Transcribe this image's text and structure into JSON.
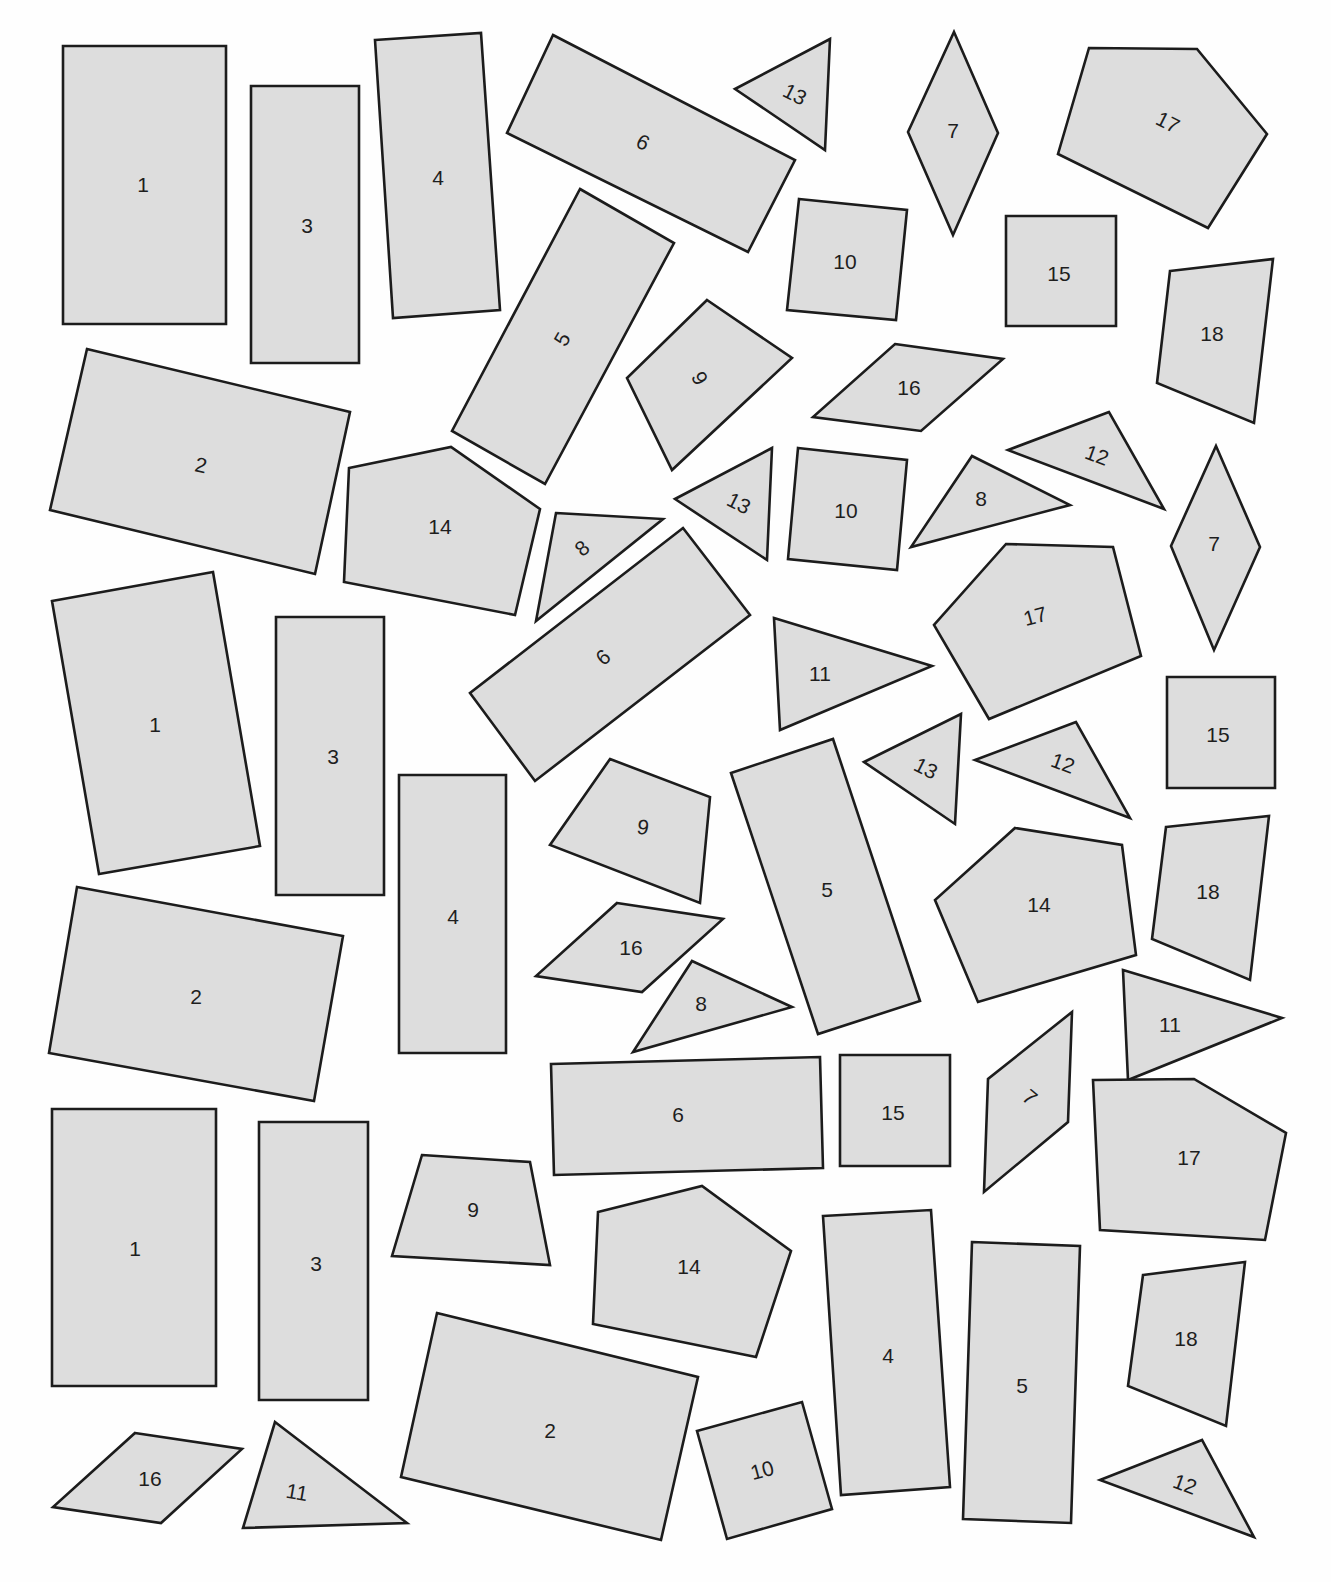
{
  "worksheet": {
    "fill_color": "#dddddd",
    "stroke_color": "#1c1c1c",
    "background_color": "#fefefe"
  },
  "shapes": [
    {
      "label": "1",
      "points": [
        [
          63,
          46
        ],
        [
          226,
          46
        ],
        [
          226,
          324
        ],
        [
          63,
          324
        ]
      ],
      "lx": 143,
      "ly": 184,
      "rot": 0
    },
    {
      "label": "3",
      "points": [
        [
          251,
          86
        ],
        [
          359,
          86
        ],
        [
          359,
          363
        ],
        [
          251,
          363
        ]
      ],
      "lx": 307,
      "ly": 225,
      "rot": 0
    },
    {
      "label": "4",
      "points": [
        [
          375,
          40
        ],
        [
          481,
          33
        ],
        [
          500,
          310
        ],
        [
          393,
          318
        ]
      ],
      "lx": 438,
      "ly": 177,
      "rot": 0
    },
    {
      "label": "6",
      "points": [
        [
          553,
          35
        ],
        [
          795,
          160
        ],
        [
          748,
          252
        ],
        [
          507,
          133
        ]
      ],
      "lx": 643,
      "ly": 142,
      "rot": 27
    },
    {
      "label": "13",
      "points": [
        [
          830,
          39
        ],
        [
          735,
          89
        ],
        [
          825,
          150
        ]
      ],
      "lx": 795,
      "ly": 94,
      "rot": 27
    },
    {
      "label": "7",
      "points": [
        [
          954,
          32
        ],
        [
          998,
          133
        ],
        [
          953,
          235
        ],
        [
          908,
          132
        ]
      ],
      "lx": 953,
      "ly": 130,
      "rot": 0
    },
    {
      "label": "17",
      "points": [
        [
          1089,
          48
        ],
        [
          1197,
          49
        ],
        [
          1267,
          134
        ],
        [
          1208,
          228
        ],
        [
          1058,
          154
        ]
      ],
      "lx": 1168,
      "ly": 122,
      "rot": 27
    },
    {
      "label": "10",
      "points": [
        [
          799,
          199
        ],
        [
          907,
          210
        ],
        [
          896,
          320
        ],
        [
          787,
          310
        ]
      ],
      "lx": 845,
      "ly": 261,
      "rot": 0
    },
    {
      "label": "15",
      "points": [
        [
          1006,
          216
        ],
        [
          1116,
          216
        ],
        [
          1116,
          326
        ],
        [
          1006,
          326
        ]
      ],
      "lx": 1059,
      "ly": 273,
      "rot": 0
    },
    {
      "label": "18",
      "points": [
        [
          1170,
          271
        ],
        [
          1273,
          259
        ],
        [
          1254,
          423
        ],
        [
          1157,
          383
        ]
      ],
      "lx": 1212,
      "ly": 333,
      "rot": 0
    },
    {
      "label": "5",
      "points": [
        [
          580,
          189
        ],
        [
          674,
          243
        ],
        [
          545,
          484
        ],
        [
          452,
          431
        ]
      ],
      "lx": 562,
      "ly": 339,
      "rot": -60
    },
    {
      "label": "2",
      "points": [
        [
          87,
          349
        ],
        [
          350,
          412
        ],
        [
          315,
          574
        ],
        [
          50,
          510
        ]
      ],
      "lx": 201,
      "ly": 465,
      "rot": 12
    },
    {
      "label": "9",
      "points": [
        [
          707,
          300
        ],
        [
          792,
          358
        ],
        [
          672,
          470
        ],
        [
          627,
          378
        ]
      ],
      "lx": 700,
      "ly": 378,
      "rot": 60
    },
    {
      "label": "16",
      "points": [
        [
          895,
          344
        ],
        [
          1003,
          359
        ],
        [
          921,
          431
        ],
        [
          813,
          417
        ]
      ],
      "lx": 909,
      "ly": 387,
      "rot": 0
    },
    {
      "label": "14",
      "points": [
        [
          349,
          468
        ],
        [
          451,
          447
        ],
        [
          540,
          509
        ],
        [
          515,
          615
        ],
        [
          344,
          582
        ]
      ],
      "lx": 440,
      "ly": 526,
      "rot": 0
    },
    {
      "label": "8",
      "points": [
        [
          556,
          513
        ],
        [
          663,
          519
        ],
        [
          536,
          621
        ]
      ],
      "lx": 582,
      "ly": 548,
      "rot": -40
    },
    {
      "label": "13",
      "points": [
        [
          772,
          448
        ],
        [
          675,
          499
        ],
        [
          767,
          560
        ]
      ],
      "lx": 739,
      "ly": 503,
      "rot": 27
    },
    {
      "label": "10",
      "points": [
        [
          798,
          448
        ],
        [
          907,
          460
        ],
        [
          897,
          570
        ],
        [
          788,
          559
        ]
      ],
      "lx": 846,
      "ly": 510,
      "rot": 0
    },
    {
      "label": "8",
      "points": [
        [
          972,
          456
        ],
        [
          1070,
          505
        ],
        [
          911,
          547
        ]
      ],
      "lx": 981,
      "ly": 498,
      "rot": 0
    },
    {
      "label": "12",
      "points": [
        [
          1109,
          412
        ],
        [
          1008,
          450
        ],
        [
          1164,
          509
        ]
      ],
      "lx": 1097,
      "ly": 455,
      "rot": 20
    },
    {
      "label": "7",
      "points": [
        [
          1216,
          446
        ],
        [
          1260,
          547
        ],
        [
          1214,
          650
        ],
        [
          1171,
          546
        ]
      ],
      "lx": 1214,
      "ly": 543,
      "rot": 0
    },
    {
      "label": "1",
      "points": [
        [
          52,
          601
        ],
        [
          213,
          572
        ],
        [
          260,
          846
        ],
        [
          99,
          874
        ]
      ],
      "lx": 155,
      "ly": 724,
      "rot": 0
    },
    {
      "label": "3",
      "points": [
        [
          276,
          617
        ],
        [
          384,
          617
        ],
        [
          384,
          895
        ],
        [
          276,
          895
        ]
      ],
      "lx": 333,
      "ly": 756,
      "rot": 0
    },
    {
      "label": "6",
      "points": [
        [
          683,
          528
        ],
        [
          750,
          615
        ],
        [
          535,
          781
        ],
        [
          470,
          693
        ]
      ],
      "lx": 603,
      "ly": 657,
      "rot": -40
    },
    {
      "label": "11",
      "points": [
        [
          774,
          618
        ],
        [
          932,
          666
        ],
        [
          780,
          730
        ]
      ],
      "lx": 820,
      "ly": 673,
      "rot": 0
    },
    {
      "label": "17",
      "points": [
        [
          1006,
          544
        ],
        [
          1113,
          547
        ],
        [
          1141,
          656
        ],
        [
          989,
          719
        ],
        [
          934,
          625
        ]
      ],
      "lx": 1035,
      "ly": 616,
      "rot": -15
    },
    {
      "label": "15",
      "points": [
        [
          1167,
          677
        ],
        [
          1275,
          677
        ],
        [
          1275,
          788
        ],
        [
          1167,
          788
        ]
      ],
      "lx": 1218,
      "ly": 734,
      "rot": 0
    },
    {
      "label": "13",
      "points": [
        [
          961,
          714
        ],
        [
          864,
          762
        ],
        [
          955,
          824
        ]
      ],
      "lx": 926,
      "ly": 768,
      "rot": 27
    },
    {
      "label": "12",
      "points": [
        [
          1076,
          722
        ],
        [
          975,
          760
        ],
        [
          1130,
          818
        ]
      ],
      "lx": 1063,
      "ly": 763,
      "rot": 20
    },
    {
      "label": "4",
      "points": [
        [
          399,
          775
        ],
        [
          506,
          775
        ],
        [
          506,
          1053
        ],
        [
          399,
          1053
        ]
      ],
      "lx": 453,
      "ly": 916,
      "rot": 0
    },
    {
      "label": "9",
      "points": [
        [
          610,
          759
        ],
        [
          710,
          797
        ],
        [
          700,
          903
        ],
        [
          550,
          845
        ]
      ],
      "lx": 643,
      "ly": 827,
      "rot": 10
    },
    {
      "label": "5",
      "points": [
        [
          731,
          773
        ],
        [
          833,
          739
        ],
        [
          920,
          1001
        ],
        [
          818,
          1034
        ]
      ],
      "lx": 827,
      "ly": 889,
      "rot": 0
    },
    {
      "label": "14",
      "points": [
        [
          1015,
          828
        ],
        [
          1122,
          845
        ],
        [
          1136,
          955
        ],
        [
          978,
          1002
        ],
        [
          935,
          900
        ]
      ],
      "lx": 1039,
      "ly": 904,
      "rot": 0
    },
    {
      "label": "18",
      "points": [
        [
          1166,
          827
        ],
        [
          1269,
          816
        ],
        [
          1250,
          980
        ],
        [
          1152,
          939
        ]
      ],
      "lx": 1208,
      "ly": 891,
      "rot": 0
    },
    {
      "label": "2",
      "points": [
        [
          77,
          887
        ],
        [
          343,
          936
        ],
        [
          314,
          1101
        ],
        [
          49,
          1053
        ]
      ],
      "lx": 196,
      "ly": 996,
      "rot": 0
    },
    {
      "label": "16",
      "points": [
        [
          617,
          903
        ],
        [
          723,
          919
        ],
        [
          642,
          992
        ],
        [
          536,
          976
        ]
      ],
      "lx": 631,
      "ly": 947,
      "rot": 0
    },
    {
      "label": "8",
      "points": [
        [
          692,
          961
        ],
        [
          792,
          1007
        ],
        [
          633,
          1052
        ]
      ],
      "lx": 701,
      "ly": 1003,
      "rot": 0
    },
    {
      "label": "11",
      "points": [
        [
          1123,
          970
        ],
        [
          1282,
          1018
        ],
        [
          1128,
          1080
        ]
      ],
      "lx": 1170,
      "ly": 1024,
      "rot": 0
    },
    {
      "label": "6",
      "points": [
        [
          551,
          1064
        ],
        [
          820,
          1057
        ],
        [
          823,
          1168
        ],
        [
          554,
          1175
        ]
      ],
      "lx": 678,
      "ly": 1114,
      "rot": 0
    },
    {
      "label": "15",
      "points": [
        [
          840,
          1055
        ],
        [
          950,
          1055
        ],
        [
          950,
          1166
        ],
        [
          840,
          1166
        ]
      ],
      "lx": 893,
      "ly": 1112,
      "rot": 0
    },
    {
      "label": "7",
      "points": [
        [
          1072,
          1012
        ],
        [
          1068,
          1122
        ],
        [
          984,
          1192
        ],
        [
          988,
          1079
        ]
      ],
      "lx": 1030,
      "ly": 1097,
      "rot": 40
    },
    {
      "label": "17",
      "points": [
        [
          1093,
          1080
        ],
        [
          1194,
          1079
        ],
        [
          1286,
          1133
        ],
        [
          1265,
          1240
        ],
        [
          1100,
          1230
        ]
      ],
      "lx": 1189,
      "ly": 1157,
      "rot": 0
    },
    {
      "label": "1",
      "points": [
        [
          52,
          1109
        ],
        [
          216,
          1109
        ],
        [
          216,
          1386
        ],
        [
          52,
          1386
        ]
      ],
      "lx": 135,
      "ly": 1248,
      "rot": 0
    },
    {
      "label": "3",
      "points": [
        [
          259,
          1122
        ],
        [
          368,
          1122
        ],
        [
          368,
          1400
        ],
        [
          259,
          1400
        ]
      ],
      "lx": 316,
      "ly": 1263,
      "rot": 0
    },
    {
      "label": "9",
      "points": [
        [
          422,
          1155
        ],
        [
          530,
          1162
        ],
        [
          550,
          1265
        ],
        [
          392,
          1256
        ]
      ],
      "lx": 473,
      "ly": 1209,
      "rot": 0
    },
    {
      "label": "14",
      "points": [
        [
          598,
          1212
        ],
        [
          702,
          1186
        ],
        [
          791,
          1251
        ],
        [
          756,
          1357
        ],
        [
          593,
          1324
        ]
      ],
      "lx": 689,
      "ly": 1266,
      "rot": 0
    },
    {
      "label": "4",
      "points": [
        [
          823,
          1216
        ],
        [
          931,
          1210
        ],
        [
          950,
          1487
        ],
        [
          841,
          1495
        ]
      ],
      "lx": 888,
      "ly": 1355,
      "rot": 0
    },
    {
      "label": "5",
      "points": [
        [
          972,
          1242
        ],
        [
          1080,
          1246
        ],
        [
          1071,
          1523
        ],
        [
          963,
          1519
        ]
      ],
      "lx": 1022,
      "ly": 1385,
      "rot": 0
    },
    {
      "label": "18",
      "points": [
        [
          1143,
          1275
        ],
        [
          1245,
          1262
        ],
        [
          1226,
          1426
        ],
        [
          1128,
          1386
        ]
      ],
      "lx": 1186,
      "ly": 1338,
      "rot": 0
    },
    {
      "label": "2",
      "points": [
        [
          437,
          1313
        ],
        [
          698,
          1377
        ],
        [
          661,
          1540
        ],
        [
          401,
          1477
        ]
      ],
      "lx": 550,
      "ly": 1430,
      "rot": 0
    },
    {
      "label": "10",
      "points": [
        [
          697,
          1431
        ],
        [
          802,
          1402
        ],
        [
          832,
          1509
        ],
        [
          727,
          1539
        ]
      ],
      "lx": 762,
      "ly": 1470,
      "rot": -15
    },
    {
      "label": "12",
      "points": [
        [
          1202,
          1440
        ],
        [
          1100,
          1480
        ],
        [
          1254,
          1537
        ]
      ],
      "lx": 1185,
      "ly": 1484,
      "rot": 20
    },
    {
      "label": "16",
      "points": [
        [
          135,
          1433
        ],
        [
          242,
          1449
        ],
        [
          161,
          1523
        ],
        [
          53,
          1507
        ]
      ],
      "lx": 150,
      "ly": 1478,
      "rot": 0
    },
    {
      "label": "11",
      "points": [
        [
          275,
          1422
        ],
        [
          407,
          1523
        ],
        [
          243,
          1528
        ]
      ],
      "lx": 297,
      "ly": 1492,
      "rot": 10
    }
  ]
}
